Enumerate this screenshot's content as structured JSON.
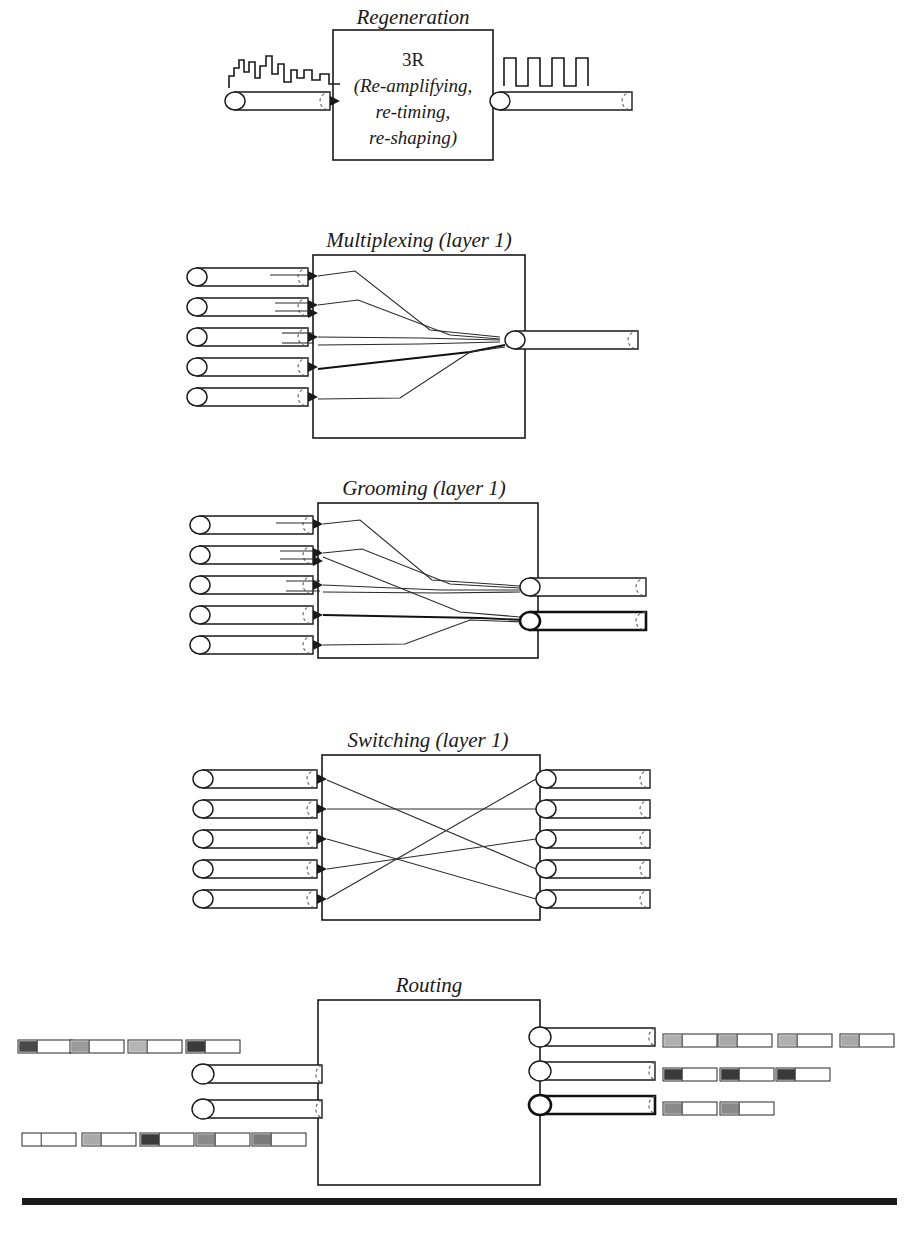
{
  "figure": {
    "width": 919,
    "height": 1237,
    "background_color": "#ffffff",
    "ink_color": "#1a1a1a"
  },
  "panels": [
    {
      "id": "regeneration",
      "title": "Regeneration",
      "box": {
        "x": 333,
        "y": 30,
        "w": 160,
        "h": 130
      },
      "box_labels": [
        "3R",
        "(Re-amplifying,",
        "re-timing,",
        "re-shaping)"
      ],
      "inputs": 1,
      "outputs": 1,
      "input_signal": "degraded-noisy-waveform",
      "output_signal": "clean-square-wave",
      "output_pulse_count": 4
    },
    {
      "id": "multiplexing",
      "title": "Multiplexing (layer 1)",
      "box": {
        "x": 313,
        "y": 255,
        "w": 212,
        "h": 183
      },
      "inputs": 5,
      "outputs": 1,
      "description": "five input fibers combined into one output fiber"
    },
    {
      "id": "grooming",
      "title": "Grooming (layer 1)",
      "box": {
        "x": 318,
        "y": 503,
        "w": 220,
        "h": 155
      },
      "inputs": 5,
      "outputs": 2,
      "description": "five input fibers regrouped onto two output fibers"
    },
    {
      "id": "switching",
      "title": "Switching (layer 1)",
      "box": {
        "x": 322,
        "y": 755,
        "w": 218,
        "h": 165
      },
      "inputs": 5,
      "outputs": 5,
      "description": "five inputs cross-connected to five outputs"
    },
    {
      "id": "routing",
      "title": "Routing",
      "box": {
        "x": 318,
        "y": 1000,
        "w": 222,
        "h": 185
      },
      "inputs": 2,
      "outputs": 3,
      "description": "packet streams routed between fibers"
    }
  ],
  "regeneration": {
    "title": "Regeneration",
    "label_3r": "3R",
    "label_line1": "(Re-amplifying,",
    "label_line2": "re-timing,",
    "label_line3": "re-shaping)",
    "input_waveform_name": "noisy-degraded-signal",
    "output_waveform_name": "regenerated-square-wave"
  },
  "routing_packets": {
    "left_rows": [
      {
        "row": "top-left",
        "count": 4,
        "header_shades": [
          "#4a4a4a",
          "#9a9a9a",
          "#b5b5b5",
          "#3a3a3a"
        ]
      },
      {
        "row": "bottom-left",
        "count": 5,
        "header_shades": [
          "#ffffff",
          "#aaaaaa",
          "#3a3a3a",
          "#8a8a8a",
          "#7a7a7a"
        ]
      }
    ],
    "right_rows": [
      {
        "row": "right-top",
        "count": 4,
        "header_shades": [
          "#b0b0b0",
          "#a8a8a8",
          "#b0b0b0",
          "#a8a8a8"
        ]
      },
      {
        "row": "right-middle",
        "count": 3,
        "header_shades": [
          "#3a3a3a",
          "#3a3a3a",
          "#3a3a3a"
        ]
      },
      {
        "row": "right-bottom",
        "count": 2,
        "header_shades": [
          "#8a8a8a",
          "#8a8a8a"
        ]
      }
    ]
  },
  "legend": {
    "pipe_meaning": "optical fiber / wavelength channel",
    "box_meaning": "network element function",
    "packet_meaning": "data packet with header"
  }
}
